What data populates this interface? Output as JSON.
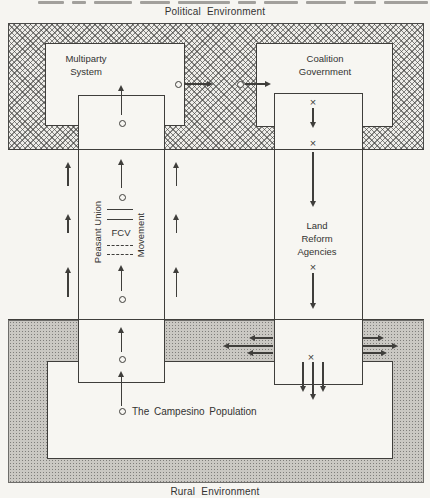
{
  "captions": {
    "political": "Political Environment",
    "rural": "Rural Environment"
  },
  "boxes": {
    "multiparty": "Multiparty System",
    "coalition": "Coalition Government",
    "land_reform": "Land Reform Agencies"
  },
  "fcv": {
    "left_vertical_label": "Peasant Union",
    "center_label": "FCV",
    "right_vertical_label": "Movement"
  },
  "population": {
    "label": "The Campesino Population"
  },
  "symbols": {
    "x": "×"
  },
  "colors": {
    "ink": "#3f3e3b",
    "paper": "#f7f6f2",
    "hatch_band": "#8d8c89",
    "stipple_band": "#cac8c3"
  }
}
